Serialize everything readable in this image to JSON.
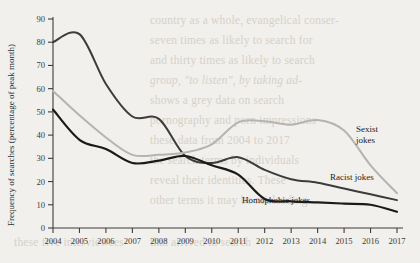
{
  "background_text": {
    "lines": [
      {
        "text": "country as a whole, evangelical conser-",
        "x": 150,
        "y": 14,
        "italic": false
      },
      {
        "text": "seven times as likely to search for",
        "x": 150,
        "y": 34,
        "italic": false
      },
      {
        "text": "and thirty times as likely to search",
        "x": 150,
        "y": 54,
        "italic": false
      },
      {
        "text": "group, \"to listen\", by taking ad-",
        "x": 150,
        "y": 74,
        "italic": true
      },
      {
        "text": "shows a grey data on search",
        "x": 150,
        "y": 94,
        "italic": false
      },
      {
        "text": "pornography and porn impressions",
        "x": 150,
        "y": 114,
        "italic": false
      },
      {
        "text": "these data from 2004 to 2017",
        "x": 150,
        "y": 134,
        "italic": false
      },
      {
        "text": "the search terms by individuals",
        "x": 150,
        "y": 154,
        "italic": false
      },
      {
        "text": "reveal their identities. These",
        "x": 150,
        "y": 174,
        "italic": false
      },
      {
        "text": "other terms it may be misleading",
        "x": 150,
        "y": 194,
        "italic": false
      },
      {
        "text": "that arrived in search",
        "x": 150,
        "y": 236,
        "italic": false
      },
      {
        "text": "these five interviewees",
        "x": 14,
        "y": 236,
        "italic": false
      }
    ]
  },
  "chart_data": {
    "type": "line",
    "title": "",
    "xlabel": "",
    "ylabel": "Frequency of searches (percentage of peak month)",
    "xlim": [
      2004,
      2017
    ],
    "ylim": [
      0,
      90
    ],
    "ytick_step": 10,
    "grid": false,
    "legend_position": "inline-right",
    "categories": [
      2004,
      2005,
      2006,
      2007,
      2008,
      2009,
      2010,
      2011,
      2012,
      2013,
      2014,
      2015,
      2016,
      2017
    ],
    "xticks": [
      "2004",
      "2005",
      "2006",
      "2007",
      "2008",
      "2009",
      "2010",
      "2011",
      "2012",
      "2013",
      "2014",
      "2015",
      "2016",
      "2017"
    ],
    "yticks": [
      "0",
      "10",
      "20",
      "30",
      "40",
      "50",
      "60",
      "70",
      "80",
      "90"
    ],
    "series": [
      {
        "name": "Racist jokes",
        "color": "#3c3c3c",
        "width": 2.0,
        "label_x": 330,
        "label_y": 180,
        "values": [
          80,
          83.5,
          62,
          48,
          47,
          31,
          28,
          30.5,
          25,
          21,
          19.5,
          17,
          14.5,
          12
        ]
      },
      {
        "name": "Sexist jokes",
        "color": "#b4b4b4",
        "width": 2.0,
        "label_x": 356,
        "label_y": 132,
        "values": [
          59,
          48.5,
          39,
          31.5,
          31.5,
          32.5,
          36,
          45.5,
          46,
          44.5,
          46.5,
          42,
          27,
          15
        ]
      },
      {
        "name": "Homophobic jokes",
        "color": "#1a1a1a",
        "width": 2.2,
        "label_x": 242,
        "label_y": 203,
        "values": [
          51,
          38,
          34,
          28,
          29,
          31,
          27,
          23,
          12.5,
          11.5,
          11,
          10.5,
          10,
          7
        ]
      }
    ]
  },
  "axes": {
    "x_axis_name": "year-axis",
    "y_axis_name": "frequency-axis"
  }
}
